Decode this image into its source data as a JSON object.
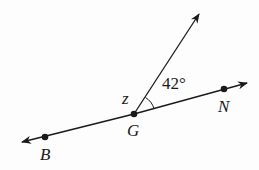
{
  "diagram": {
    "points": {
      "B": {
        "label": "B",
        "x": 45,
        "y": 137
      },
      "G": {
        "label": "G",
        "x": 134,
        "y": 114
      },
      "N": {
        "label": "N",
        "x": 224,
        "y": 89
      }
    },
    "line": {
      "from": [
        22,
        142
      ],
      "to": [
        247,
        82
      ],
      "arrows": "both"
    },
    "ray": {
      "from": [
        134,
        114
      ],
      "to": [
        199,
        14
      ],
      "arrow": "end"
    },
    "angle_label": "42°",
    "angle_var": "z",
    "colors": {
      "stroke": "#1a1a1a",
      "background": "#fdfdfd"
    }
  }
}
